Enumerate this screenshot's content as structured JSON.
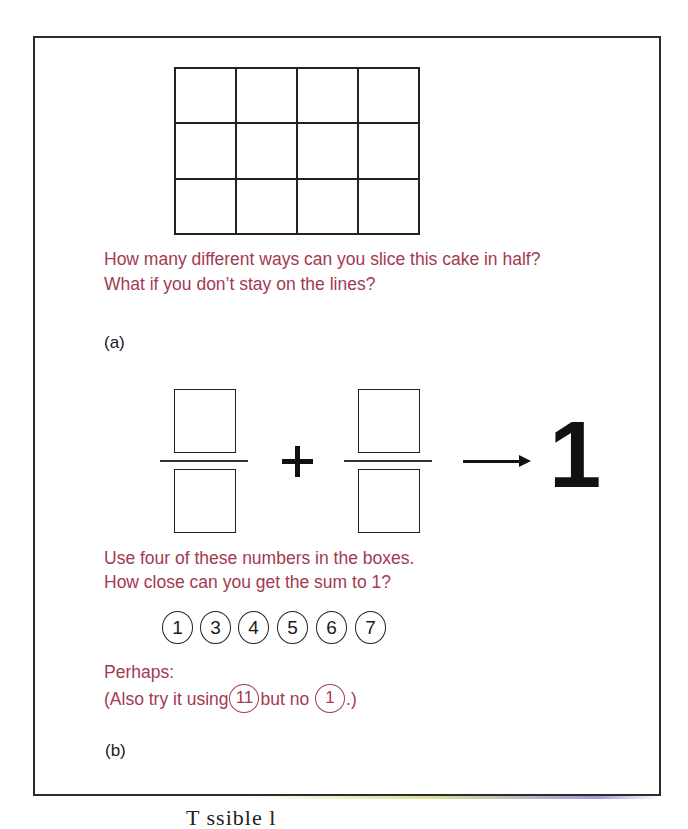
{
  "part_a": {
    "grid": {
      "rows": 3,
      "cols": 4
    },
    "question_lines": [
      "How many different ways can you slice this cake in half?",
      "What if you don’t stay on the lines?"
    ],
    "label": "(a)"
  },
  "part_b": {
    "fractions": [
      {
        "numerator": "",
        "denominator": ""
      },
      {
        "numerator": "",
        "denominator": ""
      }
    ],
    "operator": "+",
    "arrow_icon": "right-arrow-icon",
    "target": "1",
    "instruction_lines": [
      "Use four of these numbers in the boxes.",
      "How close can you get the sum to 1?"
    ],
    "numbers": [
      "1",
      "3",
      "4",
      "5",
      "6",
      "7"
    ],
    "perhaps": {
      "heading": "Perhaps:",
      "prefix": "(Also try it using",
      "use_number": "11",
      "middle": "but no",
      "exclude_number": "1",
      "suffix": ".)"
    },
    "label": "(b)"
  },
  "caption_fragment": "T    ssible  l"
}
